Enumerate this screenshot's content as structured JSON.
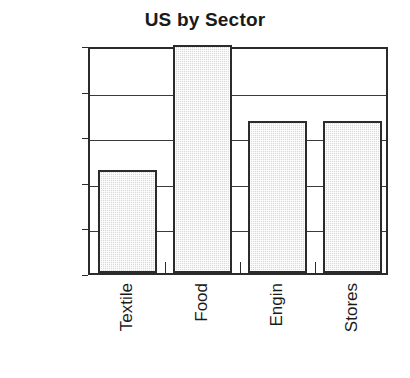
{
  "chart_data": {
    "type": "bar",
    "title": "US by Sector",
    "xlabel": "",
    "ylabel": "",
    "categories": [
      "Textile",
      "Food",
      "Engin",
      "Stores"
    ],
    "values": [
      11.3,
      25.0,
      16.7,
      16.7
    ],
    "value_labels": [
      "11.3%",
      "25.0%",
      "16.7%",
      "16.7%"
    ],
    "ylim": [
      0,
      25
    ],
    "ytick_values": [
      0,
      5,
      10,
      15,
      20,
      25
    ],
    "ytick_labels": [
      "0.0%",
      "5.0%",
      "10.0%",
      "15.0%",
      "20.0%",
      "25.0%"
    ],
    "grid": "horizontal",
    "legend": "none",
    "series": [
      {
        "name": "US by Sector",
        "values": [
          11.3,
          25.0,
          16.7,
          16.7
        ]
      }
    ],
    "style": {
      "bar_fill": "#d8d8d8",
      "bar_edge": "#2b2b2b",
      "grid_color": "#3a3a3a",
      "axis_color": "#2b2b2b",
      "text_color": "#1a1a1a",
      "background": "#ffffff"
    }
  }
}
